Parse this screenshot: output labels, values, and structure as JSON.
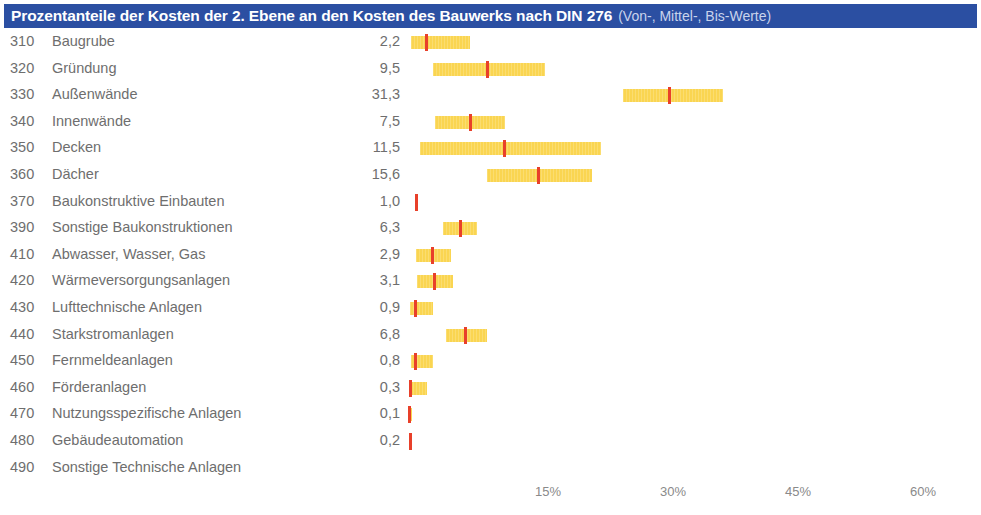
{
  "title": {
    "main": "Prozentanteile der Kosten der 2. Ebene an den Kosten des Bauwerks nach DIN 276",
    "sub": "(Von-, Mittel-, Bis-Werte)",
    "bar_color": "#2b4fa2",
    "text_color": "#ffffff",
    "sub_color": "#c9d4ec"
  },
  "colors": {
    "range_bar": "#fad551",
    "mid_marker": "#e8402a",
    "text": "#6e6e6e",
    "axis_text": "#8a8a8a",
    "background": "#ffffff"
  },
  "chart_data": {
    "type": "bar",
    "title": "Prozentanteile der Kosten der 2. Ebene an den Kosten des Bauwerks nach DIN 276 (Von-, Mittel-, Bis-Werte)",
    "xlabel": "",
    "ylabel": "",
    "xlim": [
      0,
      65
    ],
    "grid": false,
    "legend": null,
    "xticks": [
      "15%",
      "30%",
      "45%",
      "60%"
    ],
    "xtick_values": [
      15,
      30,
      45,
      60
    ],
    "value_column_header": "",
    "note": "Each row shows a horizontal range bar (Von- bis Bis-Wert) with a red marker at the Mittelwert; the numeric column is the Mittelwert in percent.",
    "categories": [
      {
        "code": "310",
        "label": "Baugrube",
        "value": "2,2",
        "mid": 2.2,
        "from": 0.4,
        "to": 7.5
      },
      {
        "code": "320",
        "label": "Gründung",
        "value": "9,5",
        "mid": 9.5,
        "from": 3.0,
        "to": 16.5
      },
      {
        "code": "330",
        "label": "Außenwände",
        "value": "31,3",
        "mid": 31.3,
        "from": 25.8,
        "to": 37.8
      },
      {
        "code": "340",
        "label": "Innenwände",
        "value": "7,5",
        "mid": 7.5,
        "from": 3.3,
        "to": 11.6
      },
      {
        "code": "350",
        "label": "Decken",
        "value": "11,5",
        "mid": 11.5,
        "from": 1.4,
        "to": 23.2
      },
      {
        "code": "360",
        "label": "Dächer",
        "value": "15,6",
        "mid": 15.6,
        "from": 9.5,
        "to": 22.1
      },
      {
        "code": "370",
        "label": "Baukonstruktive Einbauten",
        "value": "1,0",
        "mid": 1.0,
        "from": 0.8,
        "to": 1.2
      },
      {
        "code": "390",
        "label": "Sonstige Baukonstruktionen",
        "value": "6,3",
        "mid": 6.3,
        "from": 4.2,
        "to": 8.3
      },
      {
        "code": "410",
        "label": "Abwasser, Wasser, Gas",
        "value": "2,9",
        "mid": 2.9,
        "from": 1.0,
        "to": 5.2
      },
      {
        "code": "420",
        "label": "Wärmeversorgungsanlagen",
        "value": "3,1",
        "mid": 3.1,
        "from": 1.1,
        "to": 5.4
      },
      {
        "code": "430",
        "label": "Lufttechnische Anlagen",
        "value": "0,9",
        "mid": 0.9,
        "from": 0.2,
        "to": 3.0
      },
      {
        "code": "440",
        "label": "Starkstromanlagen",
        "value": "6,8",
        "mid": 6.8,
        "from": 4.6,
        "to": 9.5
      },
      {
        "code": "450",
        "label": "Fernmeldeanlagen",
        "value": "0,8",
        "mid": 0.8,
        "from": 0.4,
        "to": 3.0
      },
      {
        "code": "460",
        "label": "Förderanlagen",
        "value": "0,3",
        "mid": 0.3,
        "from": 0.2,
        "to": 2.3
      },
      {
        "code": "470",
        "label": "Nutzungsspezifische Anlagen",
        "value": "0,1",
        "mid": 0.1,
        "from": 0.1,
        "to": 0.3
      },
      {
        "code": "480",
        "label": "Gebäudeautomation",
        "value": "0,2",
        "mid": 0.2,
        "from": 0.1,
        "to": 0.4
      },
      {
        "code": "490",
        "label": "Sonstige Technische Anlagen",
        "value": "",
        "mid": null,
        "from": null,
        "to": null
      }
    ]
  }
}
